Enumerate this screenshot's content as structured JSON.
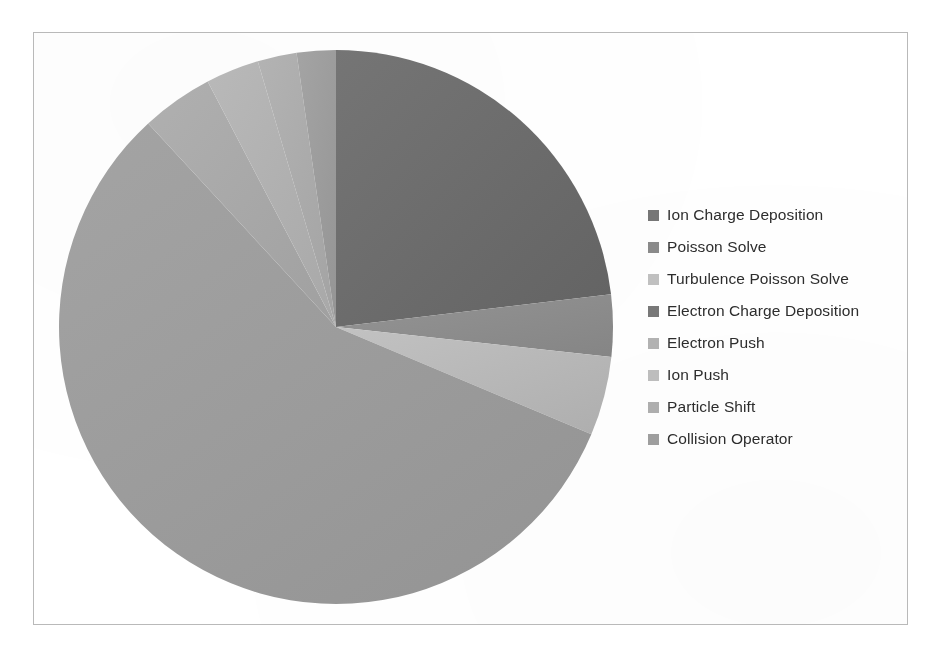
{
  "chart_data": {
    "type": "pie",
    "title": "",
    "subtitle": "",
    "xlabel": "",
    "ylabel": "",
    "legend_position": "right",
    "grid": false,
    "start_angle_deg": 0,
    "direction": "clockwise",
    "center": {
      "x": 336,
      "y": 327
    },
    "radius": 277,
    "categories": [
      "Ion Charge Deposition",
      "Poisson Solve",
      "Turbulence Poisson Solve",
      "Electron Charge Deposition",
      "Electron Push",
      "Ion Push",
      "Particle Shift",
      "Collision Operator"
    ],
    "values": [
      23.1,
      3.6,
      4.6,
      56.8,
      4.2,
      3.1,
      2.3,
      2.3
    ],
    "slice_angles_deg": [
      83.2,
      13.0,
      16.6,
      204.5,
      15.1,
      11.2,
      8.2,
      8.2
    ],
    "colors": [
      "#6f6f6f",
      "#8d8d8d",
      "#b8b8b8",
      "#9d9d9d",
      "#a7a7a7",
      "#b0b0b0",
      "#aaaaaa",
      "#9a9a9a"
    ]
  },
  "legend": {
    "items": [
      {
        "label": "Ion Charge Deposition",
        "color": "#767676"
      },
      {
        "label": "Poisson Solve",
        "color": "#8a8a8a"
      },
      {
        "label": "Turbulence Poisson Solve",
        "color": "#c0c0c0"
      },
      {
        "label": "Electron Charge Deposition",
        "color": "#787878"
      },
      {
        "label": "Electron Push",
        "color": "#b2b2b2"
      },
      {
        "label": "Ion Push",
        "color": "#bdbdbd"
      },
      {
        "label": "Particle Shift",
        "color": "#aeaeae"
      },
      {
        "label": "Collision Operator",
        "color": "#9e9e9e"
      }
    ]
  },
  "frame": {
    "border_color": "#b9b9b9",
    "background": "#ffffff"
  }
}
